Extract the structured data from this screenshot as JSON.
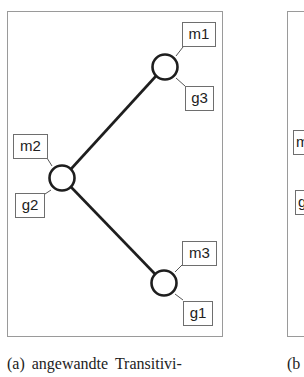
{
  "figure": {
    "panels": [
      {
        "id": "a",
        "caption": "(a) angewandte  Transitivi-",
        "nodes": [
          {
            "id": "n1",
            "top_label": "m1",
            "bottom_label": "g3",
            "cx": 165,
            "cy": 67
          },
          {
            "id": "n2",
            "top_label": "m2",
            "bottom_label": "g2",
            "cx": 62,
            "cy": 178
          },
          {
            "id": "n3",
            "top_label": "m3",
            "bottom_label": "g1",
            "cx": 164,
            "cy": 283
          }
        ],
        "edges": [
          {
            "from": "n2",
            "to": "n1"
          },
          {
            "from": "n2",
            "to": "n3"
          }
        ]
      },
      {
        "id": "b",
        "caption": "(b",
        "visible_labels": [
          "m",
          "g"
        ]
      }
    ]
  }
}
